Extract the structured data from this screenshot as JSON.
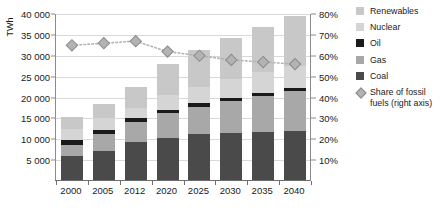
{
  "chart_data": {
    "type": "bar",
    "subtype": "stacked-bar-with-line",
    "title": "",
    "xlabel": "",
    "ylabel": "TWh",
    "y2label": "",
    "categories": [
      "2000",
      "2005",
      "2012",
      "2020",
      "2025",
      "2030",
      "2035",
      "2040"
    ],
    "ylim": [
      0,
      40000
    ],
    "yticks": [
      0,
      5000,
      10000,
      15000,
      20000,
      25000,
      30000,
      35000,
      40000
    ],
    "ytick_labels": [
      "",
      "5 000",
      "10 000",
      "15 000",
      "20 000",
      "25 000",
      "30 000",
      "35 000",
      "40 000"
    ],
    "y2lim": [
      0,
      80
    ],
    "y2ticks": [
      10,
      20,
      30,
      40,
      50,
      60,
      70,
      80
    ],
    "y2tick_labels": [
      "10%",
      "20%",
      "30%",
      "40%",
      "50%",
      "60%",
      "70%",
      "80%"
    ],
    "grid": true,
    "legend_position": "right",
    "stack_order_bottom_to_top": [
      "Coal",
      "Gas",
      "Oil",
      "Nuclear",
      "Renewables"
    ],
    "series": [
      {
        "name": "Coal",
        "color": "#4a4a4a",
        "values": [
          6000,
          7300,
          9400,
          10300,
          11200,
          11500,
          11700,
          12000
        ]
      },
      {
        "name": "Gas",
        "color": "#a8a8a8",
        "values": [
          2700,
          3900,
          4800,
          5900,
          6600,
          7700,
          8700,
          9600
        ]
      },
      {
        "name": "Oil",
        "color": "#1a1a1a",
        "values": [
          1200,
          1100,
          1000,
          900,
          850,
          800,
          750,
          700
        ]
      },
      {
        "name": "Nuclear",
        "color": "#d5d5d5",
        "values": [
          2600,
          2800,
          2400,
          3400,
          3900,
          4400,
          4900,
          5200
        ]
      },
      {
        "name": "Renewables",
        "color": "#c8c8c8",
        "values": [
          2900,
          3300,
          4900,
          7600,
          8750,
          9800,
          10950,
          12000
        ]
      }
    ],
    "totals": [
      15400,
      18400,
      22500,
      28100,
      31300,
      34200,
      37000,
      39500
    ],
    "line_series": {
      "name": "Share of fossil fuels (right axis)",
      "axis": "right",
      "unit": "%",
      "marker": "diamond",
      "color": "#b3b3b3",
      "linestyle": "dotted",
      "values": [
        65,
        66,
        67,
        62,
        60,
        58,
        57,
        56
      ]
    }
  },
  "legend": {
    "items": [
      {
        "label": "Renewables",
        "color": "#c8c8c8",
        "marker": "square"
      },
      {
        "label": "Nuclear",
        "color": "#d5d5d5",
        "marker": "square"
      },
      {
        "label": "Oil",
        "color": "#1a1a1a",
        "marker": "square"
      },
      {
        "label": "Gas",
        "color": "#a8a8a8",
        "marker": "square"
      },
      {
        "label": "Coal",
        "color": "#4a4a4a",
        "marker": "square"
      },
      {
        "label": "Share of fossil fuels (right axis)",
        "color": "#b3b3b3",
        "marker": "diamond"
      }
    ]
  }
}
